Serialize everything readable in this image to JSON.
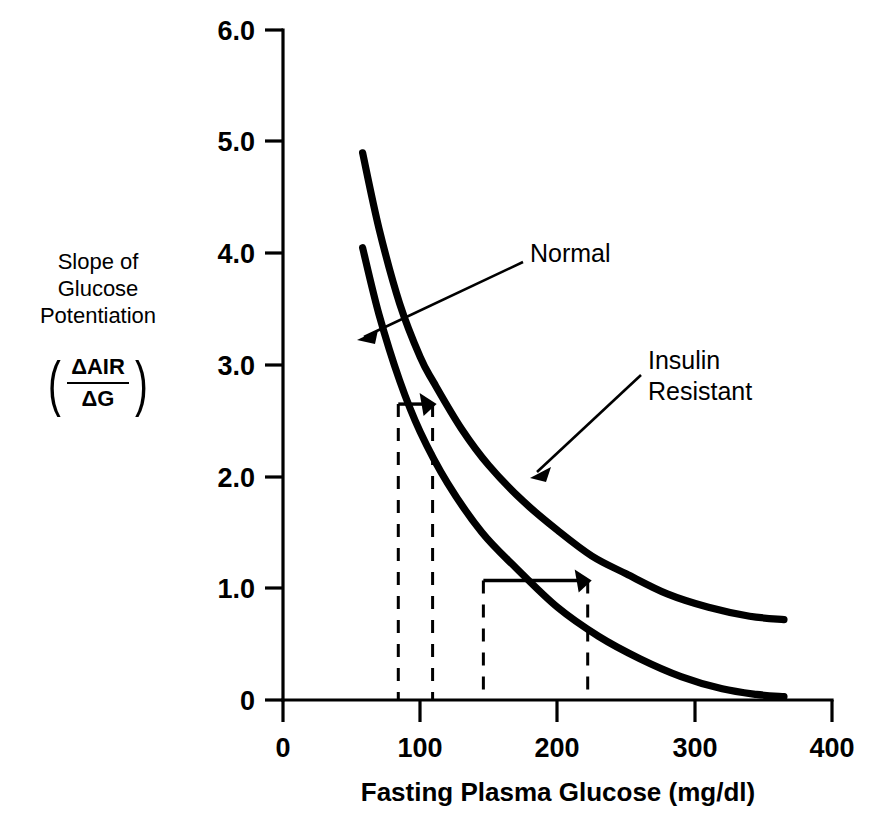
{
  "chart_data": {
    "type": "line",
    "title": "",
    "xlabel": "Fasting Plasma Glucose (mg/dl)",
    "ylabel": "Slope of Glucose Potentiation",
    "ylabel_lines": [
      "Slope of",
      "Glucose",
      "Potentiation"
    ],
    "ylabel_fraction": {
      "numerator": "ΔAIR",
      "denominator": "ΔG",
      "open_paren": "(",
      "close_paren": ")"
    },
    "xlim": [
      0,
      400
    ],
    "ylim": [
      0,
      6
    ],
    "xticks": [
      0,
      100,
      200,
      300,
      400
    ],
    "xtick_labels": [
      "0",
      "100",
      "200",
      "300",
      "400"
    ],
    "yticks": [
      0,
      1,
      2,
      3,
      4,
      5,
      6
    ],
    "ytick_labels": [
      "0",
      "1.0",
      "2.0",
      "3.0",
      "4.0",
      "5.0",
      "6.0"
    ],
    "grid": false,
    "legend_position": "inline-annotations",
    "series": [
      {
        "name": "Normal",
        "color": "#000000",
        "x": [
          58,
          70,
          85,
          100,
          120,
          145,
          170,
          200,
          230,
          260,
          290,
          320,
          345,
          365
        ],
        "y": [
          4.05,
          3.45,
          2.86,
          2.4,
          1.94,
          1.5,
          1.18,
          0.83,
          0.57,
          0.37,
          0.21,
          0.1,
          0.05,
          0.03
        ]
      },
      {
        "name": "Insulin Resistant",
        "color": "#000000",
        "x": [
          58,
          70,
          85,
          100,
          110,
          130,
          150,
          175,
          200,
          225,
          250,
          280,
          310,
          340,
          365
        ],
        "y": [
          4.9,
          4.22,
          3.55,
          3.07,
          2.84,
          2.43,
          2.1,
          1.78,
          1.52,
          1.29,
          1.13,
          0.95,
          0.83,
          0.75,
          0.72
        ]
      }
    ],
    "annotations": [
      {
        "label": "Normal",
        "target_series": "Normal",
        "label_x": 530,
        "label_y": 252,
        "lines": [
          "Normal"
        ]
      },
      {
        "label": "Insulin Resistant",
        "target_series": "Insulin Resistant",
        "label_x": 648,
        "label_y": 360,
        "lines": [
          "Insulin",
          "Resistant"
        ]
      }
    ],
    "shift_arrows": [
      {
        "y_value": 2.65,
        "x_from": 84,
        "x_to": 109,
        "description": "glucose shift at slope 2.65"
      },
      {
        "y_value": 1.07,
        "x_from": 146,
        "x_to": 222,
        "description": "glucose shift at slope 1.07"
      }
    ],
    "dashed_drop_lines": [
      {
        "x_value": 84,
        "y_top": 2.65
      },
      {
        "x_value": 109,
        "y_top": 2.65
      },
      {
        "x_value": 146,
        "y_top": 1.07
      },
      {
        "x_value": 222,
        "y_top": 1.07
      }
    ]
  }
}
